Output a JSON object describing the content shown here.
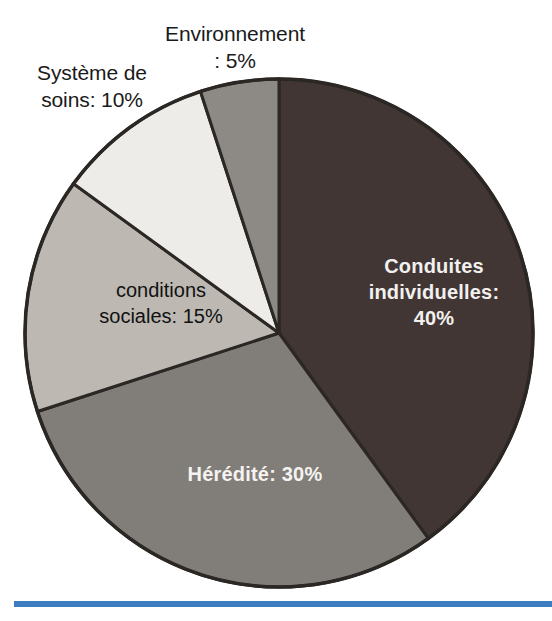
{
  "figure": {
    "title": "",
    "background_color": "#ffffff"
  },
  "chart_data": {
    "type": "pie",
    "title": "",
    "xlabel": "",
    "ylabel": "",
    "legend_position": "none",
    "grid": false,
    "start_angle_deg": 0,
    "direction": "clockwise",
    "categories": [
      "Conduites individuelles",
      "Hérédité",
      "conditions sociales",
      "Système de soins",
      "Environnement"
    ],
    "values": [
      40,
      30,
      15,
      10,
      5
    ],
    "unit": "%",
    "labels": [
      "Conduites\nindividuelles:\n40%",
      "Hérédité: 30%",
      "conditions\nsociales: 15%",
      "Système de\nsoins: 10%",
      "Environnement\n: 5%"
    ],
    "colors": [
      "#413634",
      "#817d78",
      "#bdb9b2",
      "#eeece8",
      "#8d8a85"
    ],
    "label_colors": [
      "#f2f1ef",
      "#f4f3f1",
      "#111111",
      "#1a1a1a",
      "#1a1a1a"
    ],
    "label_placement": [
      "inside",
      "inside",
      "inside",
      "outside",
      "outside"
    ],
    "slice_outline_color": "#2b2724"
  },
  "labels": {
    "environnement": "Environnement\n: 5%",
    "systeme_de_soins": "Système de\nsoins: 10%",
    "conditions_sociales": "conditions\nsociales: 15%",
    "conduites_individuelles": "Conduites\nindividuelles:\n40%",
    "heredite": "Hérédité: 30%"
  },
  "decorations": {
    "bottom_rule_color": "#3e7cc0"
  }
}
